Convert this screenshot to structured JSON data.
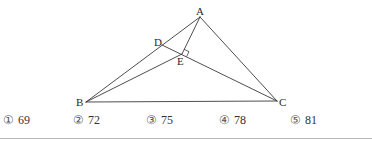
{
  "figure": {
    "points": {
      "A": {
        "label": "A",
        "x": 200,
        "y": 17
      },
      "B": {
        "label": "B",
        "x": 86,
        "y": 102
      },
      "C": {
        "label": "C",
        "x": 277,
        "y": 101
      },
      "D": {
        "label": "D",
        "x": 162,
        "y": 45
      },
      "E": {
        "label": "E",
        "x": 182,
        "y": 54
      }
    },
    "segments": [
      "AB",
      "AC",
      "BC",
      "DC",
      "AE",
      "BE"
    ],
    "right_angle_at": "E"
  },
  "choices": [
    {
      "num": "①",
      "value": "69"
    },
    {
      "num": "②",
      "value": "72"
    },
    {
      "num": "③",
      "value": "75"
    },
    {
      "num": "④",
      "value": "78"
    },
    {
      "num": "⑤",
      "value": "81"
    }
  ]
}
